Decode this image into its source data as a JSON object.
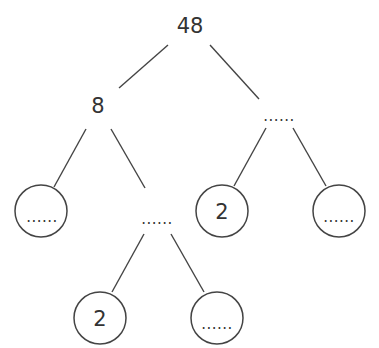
{
  "diagram": {
    "type": "factor-tree",
    "root": {
      "label": "48"
    },
    "nodes": {
      "n8": {
        "label": "8"
      },
      "n_right_blank": {
        "label": "......"
      },
      "n_left_leaf": {
        "label": "......",
        "circled": true
      },
      "n_mid_blank": {
        "label": "......"
      },
      "n_right_two": {
        "label": "2",
        "circled": true
      },
      "n_right_leaf": {
        "label": "......",
        "circled": true
      },
      "n_bottom_two": {
        "label": "2",
        "circled": true
      },
      "n_bottom_leaf": {
        "label": "......",
        "circled": true
      }
    },
    "edges": [
      [
        "48",
        "8"
      ],
      [
        "48",
        "......(right)"
      ],
      [
        "8",
        "......(circled left)"
      ],
      [
        "8",
        "......(middle)"
      ],
      [
        "......(right)",
        "2"
      ],
      [
        "......(right)",
        "......(circled right)"
      ],
      [
        "......(middle)",
        "2"
      ],
      [
        "......(middle)",
        "......(circled bottom)"
      ]
    ],
    "colors": {
      "stroke": "#444444",
      "text": "#333333",
      "background": "#ffffff"
    }
  }
}
